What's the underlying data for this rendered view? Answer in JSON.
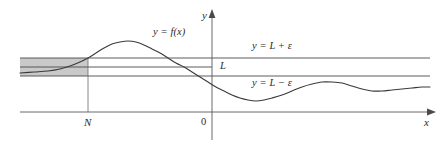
{
  "figure": {
    "type": "math-diagram",
    "colors": {
      "curve": "#3a3a3a",
      "axis": "#5a5a5a",
      "band_line": "#4a4a4a",
      "band_fill": "#c9c9c9",
      "text": "#2b2b2b",
      "background": "#ffffff"
    }
  },
  "labels": {
    "function": "y = f(x)",
    "upper_bound": "y = L + ε",
    "limit": "L",
    "lower_bound": "y = L − ε",
    "x_axis": "x",
    "y_axis": "y",
    "origin": "0",
    "n_marker": "N"
  },
  "chart_data": {
    "type": "line",
    "title": "",
    "xlabel": "x",
    "ylabel": "y",
    "grid": false,
    "legend": "none",
    "annotations": [
      {
        "text": "y = f(x)",
        "x_px": 153,
        "y_px": 33
      },
      {
        "text": "y = L + ε",
        "x_px": 252,
        "y_px": 47
      },
      {
        "text": "L",
        "x_px": 220,
        "y_px": 67
      },
      {
        "text": "y = L − ε",
        "x_px": 252,
        "y_px": 84
      },
      {
        "text": "N",
        "x_px": 88,
        "y_px": 123
      },
      {
        "text": "0",
        "x_px": 204,
        "y_px": 123
      },
      {
        "text": "x",
        "x_px": 427,
        "y_px": 123
      },
      {
        "text": "y",
        "x_px": 206,
        "y_px": 16
      }
    ],
    "reference_lines": [
      {
        "name": "y = L + ε",
        "y_px": 58,
        "x_start_px": 20,
        "x_end_px": 430
      },
      {
        "name": "L",
        "y_px": 67,
        "x_start_px": 20,
        "x_end_px": 212
      },
      {
        "name": "y = L − ε",
        "y_px": 76,
        "x_start_px": 20,
        "x_end_px": 430
      }
    ],
    "shaded_region": {
      "name": "epsilon-band-left-of-N",
      "x_start_px": 20,
      "x_end_px": 88,
      "y_top_px": 58,
      "y_bottom_px": 76
    },
    "vertical_marker": {
      "name": "N",
      "x_px": 88,
      "y_top_px": 58,
      "y_bottom_px": 112
    },
    "axes": {
      "x_axis_y_px": 112,
      "y_axis_x_px": 212,
      "x_range_px": [
        20,
        430
      ],
      "y_range_px": [
        13,
        140
      ]
    },
    "curve_points_px": [
      [
        20,
        73
      ],
      [
        34,
        72
      ],
      [
        48,
        71
      ],
      [
        60,
        69
      ],
      [
        70,
        66
      ],
      [
        80,
        62
      ],
      [
        88,
        58
      ],
      [
        96,
        53
      ],
      [
        104,
        48
      ],
      [
        112,
        44
      ],
      [
        120,
        42
      ],
      [
        128,
        41
      ],
      [
        136,
        42
      ],
      [
        144,
        45
      ],
      [
        152,
        49
      ],
      [
        160,
        53
      ],
      [
        168,
        58
      ],
      [
        176,
        63
      ],
      [
        184,
        67
      ],
      [
        192,
        72
      ],
      [
        200,
        77
      ],
      [
        208,
        82
      ],
      [
        216,
        87
      ],
      [
        224,
        91
      ],
      [
        232,
        95
      ],
      [
        240,
        98
      ],
      [
        248,
        100
      ],
      [
        256,
        101
      ],
      [
        264,
        100
      ],
      [
        272,
        98
      ],
      [
        282,
        95
      ],
      [
        292,
        91
      ],
      [
        302,
        87
      ],
      [
        312,
        84
      ],
      [
        322,
        82
      ],
      [
        332,
        82
      ],
      [
        342,
        83
      ],
      [
        352,
        86
      ],
      [
        362,
        89
      ],
      [
        372,
        91
      ],
      [
        382,
        91
      ],
      [
        392,
        90
      ],
      [
        402,
        89
      ],
      [
        412,
        88
      ],
      [
        422,
        87
      ],
      [
        430,
        87
      ]
    ]
  }
}
